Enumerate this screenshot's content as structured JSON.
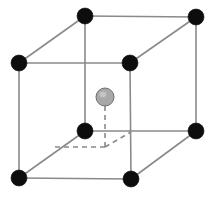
{
  "figure": {
    "name": "body-centered-cubic-unit-cell",
    "title": "Body-Centered Cubic (BCC) Unit Cell",
    "background_color": "#ffffff",
    "width": 211,
    "height": 200
  },
  "style": {
    "edge_color": "#8a8a8a",
    "edge_width": 1.6,
    "hidden_edge_color": "#8a8a8a",
    "hidden_edge_width": 1.6,
    "hidden_edge_dash": "6,4",
    "corner_atom_fill": "#0d0d0d",
    "corner_atom_stroke": "#0d0d0d",
    "corner_atom_radius": 8,
    "center_atom_fill": "#a8a8a8",
    "center_atom_stroke": "#6e6e6e",
    "center_atom_highlight": "#c9c9c9",
    "center_atom_radius": 9,
    "center_link_color": "#8a8a8a",
    "center_link_dash": "5,4"
  },
  "chart_data": {
    "type": "scatter",
    "title": "Body-Centered Cubic (BCC) Unit Cell",
    "xlabel": "",
    "ylabel": "",
    "projection": "oblique-cabinet",
    "cell_type": "body-centered cubic",
    "atom_count": 9,
    "corner_atom_count": 8,
    "center_atom_count": 1,
    "atoms": [
      {
        "id": "corner-back-top-left",
        "lattice": [
          0,
          1,
          1
        ],
        "x": 85,
        "y": 16,
        "role": "corner",
        "color": "#0d0d0d",
        "r": 8,
        "visible": true
      },
      {
        "id": "corner-back-top-right",
        "lattice": [
          1,
          1,
          1
        ],
        "x": 196,
        "y": 17,
        "role": "corner",
        "color": "#0d0d0d",
        "r": 8,
        "visible": true
      },
      {
        "id": "corner-front-top-left",
        "lattice": [
          0,
          1,
          0
        ],
        "x": 19,
        "y": 63,
        "role": "corner",
        "color": "#0d0d0d",
        "r": 8,
        "visible": true
      },
      {
        "id": "corner-front-top-right",
        "lattice": [
          1,
          1,
          0
        ],
        "x": 130,
        "y": 63,
        "role": "corner",
        "color": "#0d0d0d",
        "r": 8,
        "visible": true
      },
      {
        "id": "corner-back-bottom-left",
        "lattice": [
          0,
          0,
          1
        ],
        "x": 85,
        "y": 131,
        "role": "corner",
        "color": "#0d0d0d",
        "r": 8,
        "visible": true
      },
      {
        "id": "corner-back-bottom-right",
        "lattice": [
          1,
          0,
          1
        ],
        "x": 196,
        "y": 131,
        "role": "corner",
        "color": "#0d0d0d",
        "r": 8,
        "visible": true
      },
      {
        "id": "corner-front-bottom-left",
        "lattice": [
          0,
          0,
          0
        ],
        "x": 19,
        "y": 178,
        "role": "corner",
        "color": "#0d0d0d",
        "r": 8,
        "visible": true
      },
      {
        "id": "corner-front-bottom-right",
        "lattice": [
          1,
          0,
          0
        ],
        "x": 131,
        "y": 179,
        "role": "corner",
        "color": "#0d0d0d",
        "r": 8,
        "visible": true
      },
      {
        "id": "center-body-atom",
        "lattice": [
          0.5,
          0.5,
          0.5
        ],
        "x": 105,
        "y": 97,
        "role": "body-center",
        "color": "#a8a8a8",
        "r": 9,
        "visible": true
      }
    ],
    "edges": [
      {
        "id": "edge-top-front",
        "from": "corner-front-top-left",
        "to": "corner-front-top-right",
        "hidden": false
      },
      {
        "id": "edge-top-back",
        "from": "corner-back-top-left",
        "to": "corner-back-top-right",
        "hidden": false
      },
      {
        "id": "edge-top-left",
        "from": "corner-front-top-left",
        "to": "corner-back-top-left",
        "hidden": false
      },
      {
        "id": "edge-top-right",
        "from": "corner-front-top-right",
        "to": "corner-back-top-right",
        "hidden": false
      },
      {
        "id": "edge-bottom-front",
        "from": "corner-front-bottom-left",
        "to": "corner-front-bottom-right",
        "hidden": false
      },
      {
        "id": "edge-bottom-back",
        "from": "corner-back-bottom-left",
        "to": "corner-back-bottom-right",
        "hidden": false
      },
      {
        "id": "edge-bottom-left",
        "from": "corner-front-bottom-left",
        "to": "corner-back-bottom-left",
        "hidden": false
      },
      {
        "id": "edge-bottom-right",
        "from": "corner-front-bottom-right",
        "to": "corner-back-bottom-right",
        "hidden": false
      },
      {
        "id": "edge-vert-front-left",
        "from": "corner-front-top-left",
        "to": "corner-front-bottom-left",
        "hidden": false
      },
      {
        "id": "edge-vert-front-right",
        "from": "corner-front-top-right",
        "to": "corner-front-bottom-right",
        "hidden": false
      },
      {
        "id": "edge-vert-back-left",
        "from": "corner-back-top-left",
        "to": "corner-back-bottom-left",
        "hidden": false
      },
      {
        "id": "edge-vert-back-right",
        "from": "corner-back-top-right",
        "to": "corner-back-bottom-right",
        "hidden": false
      }
    ],
    "guide_lines": [
      {
        "id": "guide-center-drop",
        "x1": 105,
        "y1": 97,
        "x2": 105,
        "y2": 147,
        "dashed": true
      },
      {
        "id": "guide-base-left",
        "x1": 105,
        "y1": 147,
        "x2": 52,
        "y2": 147,
        "dashed": true
      },
      {
        "id": "guide-base-diagonal",
        "x1": 105,
        "y1": 147,
        "x2": 131,
        "y2": 132,
        "dashed": true
      }
    ]
  }
}
